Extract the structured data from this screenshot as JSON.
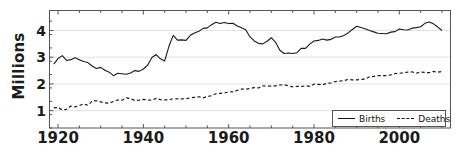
{
  "chart_data": {
    "type": "line",
    "title": "",
    "xlabel": "",
    "ylabel": "Millions",
    "xlim": [
      1918,
      2012
    ],
    "ylim": [
      0.35,
      4.75
    ],
    "grid": true,
    "y_ticks": [
      "1",
      "2",
      "3",
      "4"
    ],
    "y_tick_values": [
      1,
      2,
      3,
      4
    ],
    "x_ticks": [
      "1920",
      "1940",
      "1960",
      "1980",
      "2000"
    ],
    "x_tick_values": [
      1920,
      1940,
      1960,
      1980,
      2000
    ],
    "x_minor_tick_step": 5,
    "legend": {
      "position": "bottom-right",
      "entries": [
        {
          "name": "Births",
          "style": "solid"
        },
        {
          "name": "Deaths",
          "style": "dashed"
        }
      ]
    },
    "colors": {
      "births_line": "#1a1a1a",
      "deaths_line": "#1a1a1a",
      "grid": "#e2e2e2",
      "frame": "#555555",
      "background": "#ffffff",
      "text": "#1b1b1b"
    },
    "x": [
      1919,
      1920,
      1921,
      1922,
      1923,
      1924,
      1925,
      1926,
      1927,
      1928,
      1929,
      1930,
      1931,
      1932,
      1933,
      1934,
      1935,
      1936,
      1937,
      1938,
      1939,
      1940,
      1941,
      1942,
      1943,
      1944,
      1945,
      1946,
      1947,
      1948,
      1949,
      1950,
      1951,
      1952,
      1953,
      1954,
      1955,
      1956,
      1957,
      1958,
      1959,
      1960,
      1961,
      1962,
      1963,
      1964,
      1965,
      1966,
      1967,
      1968,
      1969,
      1970,
      1971,
      1972,
      1973,
      1974,
      1975,
      1976,
      1977,
      1978,
      1979,
      1980,
      1981,
      1982,
      1983,
      1984,
      1985,
      1986,
      1987,
      1988,
      1989,
      1990,
      1991,
      1992,
      1993,
      1994,
      1995,
      1996,
      1997,
      1998,
      1999,
      2000,
      2001,
      2002,
      2003,
      2004,
      2005,
      2006,
      2007,
      2008,
      2009,
      2010
    ],
    "series": [
      {
        "name": "Births",
        "style": "solid",
        "values": [
          2.74,
          2.95,
          3.06,
          2.88,
          2.91,
          2.98,
          2.91,
          2.84,
          2.8,
          2.67,
          2.58,
          2.62,
          2.51,
          2.44,
          2.31,
          2.4,
          2.38,
          2.36,
          2.41,
          2.5,
          2.47,
          2.56,
          2.7,
          2.99,
          3.1,
          2.94,
          2.86,
          3.41,
          3.82,
          3.64,
          3.65,
          3.63,
          3.82,
          3.91,
          3.97,
          4.08,
          4.1,
          4.22,
          4.31,
          4.26,
          4.3,
          4.26,
          4.27,
          4.17,
          4.1,
          4.03,
          3.76,
          3.61,
          3.52,
          3.5,
          3.6,
          3.73,
          3.56,
          3.26,
          3.14,
          3.16,
          3.14,
          3.17,
          3.33,
          3.33,
          3.49,
          3.61,
          3.63,
          3.68,
          3.64,
          3.67,
          3.76,
          3.76,
          3.81,
          3.91,
          4.04,
          4.16,
          4.11,
          4.07,
          4.0,
          3.95,
          3.9,
          3.89,
          3.88,
          3.94,
          3.96,
          4.06,
          4.03,
          4.02,
          4.09,
          4.11,
          4.14,
          4.27,
          4.32,
          4.25,
          4.13,
          4.0
        ]
      },
      {
        "name": "Deaths",
        "style": "dashed",
        "values": [
          1.1,
          1.12,
          1.02,
          1.05,
          1.17,
          1.14,
          1.19,
          1.25,
          1.2,
          1.36,
          1.37,
          1.33,
          1.29,
          1.28,
          1.34,
          1.4,
          1.39,
          1.48,
          1.45,
          1.38,
          1.39,
          1.42,
          1.4,
          1.39,
          1.46,
          1.41,
          1.4,
          1.4,
          1.45,
          1.44,
          1.44,
          1.45,
          1.48,
          1.5,
          1.52,
          1.48,
          1.53,
          1.56,
          1.63,
          1.65,
          1.66,
          1.71,
          1.7,
          1.76,
          1.81,
          1.8,
          1.83,
          1.86,
          1.85,
          1.93,
          1.92,
          1.92,
          1.93,
          1.96,
          1.97,
          1.93,
          1.89,
          1.91,
          1.9,
          1.93,
          1.91,
          1.99,
          1.98,
          1.97,
          2.02,
          2.04,
          2.09,
          2.11,
          2.12,
          2.17,
          2.15,
          2.15,
          2.17,
          2.18,
          2.27,
          2.28,
          2.31,
          2.31,
          2.31,
          2.34,
          2.39,
          2.4,
          2.42,
          2.44,
          2.45,
          2.4,
          2.45,
          2.43,
          2.42,
          2.47,
          2.44,
          2.47
        ]
      }
    ]
  }
}
